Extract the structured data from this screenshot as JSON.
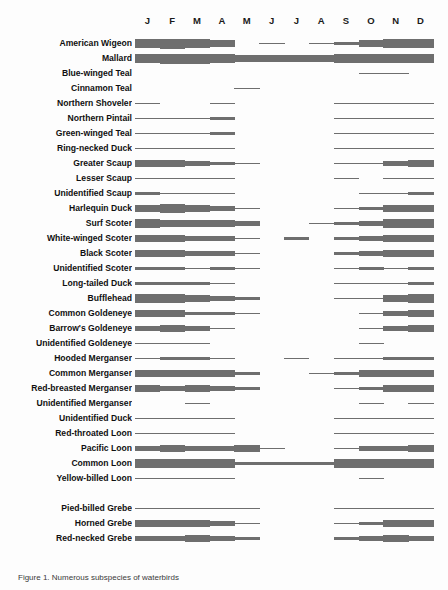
{
  "figure": {
    "caption": "Figure 1. Numerous subspecies of waterbirds"
  },
  "axis": {
    "months": [
      "J",
      "F",
      "M",
      "A",
      "M",
      "J",
      "J",
      "A",
      "S",
      "O",
      "N",
      "D"
    ],
    "x_start_px": 135,
    "x_width_px": 298
  },
  "style": {
    "band_color": "#6e6e6e",
    "label_color": "#101010",
    "background": "#fdfdfd"
  },
  "chart_data": {
    "type": "area",
    "xlabel": "Month",
    "ylabel": "Relative abundance (band thickness)",
    "x": [
      "J",
      "F",
      "M",
      "A",
      "M",
      "J",
      "J",
      "A",
      "S",
      "O",
      "N",
      "D"
    ],
    "grid": false,
    "legend": "none",
    "note": "Each row is one species; horizontal band thickness encodes relative abundance through the year. Values 0 = absent, 1 = thin line (rare), 2-5 = increasingly thick bands.",
    "series": [
      {
        "name": "American Wigeon",
        "values": [
          5,
          6,
          5,
          4,
          0,
          1,
          0,
          1,
          2,
          4,
          5,
          5
        ]
      },
      {
        "name": "Mallard",
        "values": [
          5,
          6,
          6,
          5,
          4,
          4,
          4,
          4,
          5,
          5,
          5,
          5
        ]
      },
      {
        "name": "Blue-winged Teal",
        "values": [
          0,
          0,
          0,
          0,
          0,
          0,
          0,
          0,
          0,
          1,
          1,
          0
        ]
      },
      {
        "name": "Cinnamon Teal",
        "values": [
          0,
          0,
          0,
          0,
          1,
          0,
          0,
          0,
          0,
          0,
          0,
          0
        ]
      },
      {
        "name": "Northern Shoveler",
        "values": [
          1,
          0,
          0,
          1,
          0,
          0,
          0,
          0,
          1,
          1,
          1,
          1
        ]
      },
      {
        "name": "Northern Pintail",
        "values": [
          1,
          1,
          1,
          2,
          0,
          0,
          0,
          0,
          1,
          1,
          1,
          1
        ]
      },
      {
        "name": "Green-winged Teal",
        "values": [
          1,
          1,
          1,
          2,
          0,
          0,
          0,
          0,
          1,
          1,
          1,
          1
        ]
      },
      {
        "name": "Ring-necked Duck",
        "values": [
          1,
          1,
          1,
          1,
          0,
          0,
          0,
          0,
          1,
          1,
          1,
          1
        ]
      },
      {
        "name": "Greater Scaup",
        "values": [
          4,
          4,
          3,
          2,
          1,
          0,
          0,
          0,
          1,
          1,
          3,
          4
        ]
      },
      {
        "name": "Lesser Scaup",
        "values": [
          1,
          1,
          1,
          1,
          0,
          0,
          0,
          0,
          1,
          0,
          1,
          1
        ]
      },
      {
        "name": "Unidentified Scaup",
        "values": [
          2,
          1,
          1,
          1,
          0,
          0,
          0,
          0,
          0,
          1,
          1,
          2
        ]
      },
      {
        "name": "Harlequin Duck",
        "values": [
          4,
          5,
          4,
          3,
          1,
          0,
          0,
          0,
          1,
          2,
          4,
          4
        ]
      },
      {
        "name": "Surf Scoter",
        "values": [
          5,
          4,
          4,
          4,
          3,
          0,
          0,
          1,
          2,
          3,
          5,
          5
        ]
      },
      {
        "name": "White-winged Scoter",
        "values": [
          4,
          4,
          3,
          3,
          1,
          0,
          2,
          0,
          2,
          3,
          4,
          4
        ]
      },
      {
        "name": "Black Scoter",
        "values": [
          4,
          4,
          3,
          3,
          1,
          0,
          0,
          0,
          2,
          3,
          4,
          4
        ]
      },
      {
        "name": "Unidentified Scoter",
        "values": [
          2,
          2,
          1,
          2,
          1,
          0,
          0,
          0,
          1,
          2,
          1,
          2
        ]
      },
      {
        "name": "Long-tailed Duck",
        "values": [
          2,
          2,
          2,
          1,
          0,
          0,
          0,
          0,
          1,
          1,
          1,
          2
        ]
      },
      {
        "name": "Bufflehead",
        "values": [
          5,
          5,
          4,
          3,
          2,
          0,
          0,
          0,
          1,
          1,
          4,
          5
        ]
      },
      {
        "name": "Common Goldeneye",
        "values": [
          4,
          4,
          2,
          2,
          1,
          0,
          0,
          0,
          0,
          1,
          3,
          4
        ]
      },
      {
        "name": "Barrow's Goldeneye",
        "values": [
          3,
          4,
          3,
          1,
          0,
          0,
          0,
          0,
          0,
          1,
          3,
          4
        ]
      },
      {
        "name": "Unidentified Goldeneye",
        "values": [
          1,
          1,
          1,
          0,
          0,
          0,
          0,
          0,
          0,
          1,
          0,
          0
        ]
      },
      {
        "name": "Hooded Merganser",
        "values": [
          1,
          2,
          2,
          1,
          0,
          0,
          1,
          0,
          1,
          1,
          2,
          2
        ]
      },
      {
        "name": "Common Merganser",
        "values": [
          4,
          4,
          4,
          4,
          2,
          0,
          0,
          1,
          2,
          4,
          4,
          4
        ]
      },
      {
        "name": "Red-breasted Merganser",
        "values": [
          4,
          3,
          4,
          3,
          2,
          0,
          0,
          0,
          1,
          2,
          4,
          4
        ]
      },
      {
        "name": "Unidentified Merganser",
        "values": [
          0,
          0,
          1,
          0,
          0,
          0,
          0,
          0,
          0,
          1,
          0,
          1
        ]
      },
      {
        "name": "Unidentified Duck",
        "values": [
          1,
          1,
          1,
          1,
          0,
          0,
          0,
          0,
          1,
          1,
          1,
          1
        ]
      },
      {
        "name": "Red-throated Loon",
        "values": [
          1,
          1,
          1,
          1,
          0,
          0,
          0,
          0,
          1,
          1,
          1,
          1
        ]
      },
      {
        "name": "Pacific Loon",
        "values": [
          3,
          4,
          3,
          3,
          4,
          1,
          0,
          0,
          1,
          3,
          3,
          4
        ]
      },
      {
        "name": "Common Loon",
        "values": [
          5,
          5,
          5,
          5,
          2,
          2,
          2,
          2,
          5,
          5,
          5,
          5
        ]
      },
      {
        "name": "Yellow-billed Loon",
        "values": [
          1,
          1,
          1,
          1,
          0,
          0,
          0,
          0,
          0,
          1,
          0,
          0
        ]
      },
      {
        "name": "Pied-billed Grebe",
        "values": [
          1,
          1,
          1,
          1,
          1,
          0,
          0,
          0,
          1,
          1,
          1,
          1
        ]
      },
      {
        "name": "Horned Grebe",
        "values": [
          4,
          4,
          4,
          3,
          1,
          0,
          0,
          0,
          1,
          2,
          4,
          4
        ]
      },
      {
        "name": "Red-necked Grebe",
        "values": [
          3,
          3,
          4,
          3,
          2,
          0,
          0,
          0,
          2,
          3,
          4,
          3
        ]
      }
    ]
  }
}
